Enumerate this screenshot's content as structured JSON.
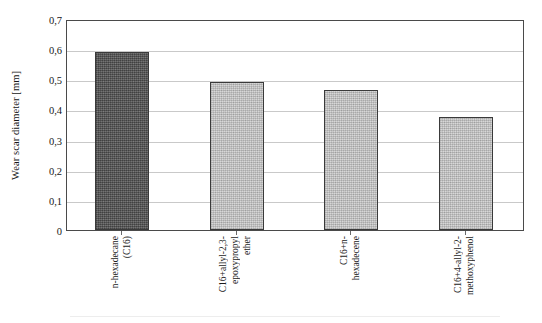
{
  "chart_data": {
    "type": "bar",
    "title": "",
    "xlabel": "",
    "ylabel": "Wear scar diameter [mm]",
    "ylim": [
      0,
      0.7
    ],
    "grid": true,
    "legend": "none",
    "decimal_separator": ",",
    "ytick_labels": [
      "0",
      "0,1",
      "0,2",
      "0,3",
      "0,4",
      "0,5",
      "0,6",
      "0,7"
    ],
    "ytick_values": [
      0,
      0.1,
      0.2,
      0.3,
      0.4,
      0.5,
      0.6,
      0.7
    ],
    "categories": [
      "n-hexadecane (C16)",
      "C16+allyl-2,3-epoxypropyl ether",
      "C16+n-hexadecene",
      "C16+4-allyl-2-methoxyphenol"
    ],
    "category_lines": [
      [
        "n-hexadecane",
        "(C16)"
      ],
      [
        "C16+allyl-2,3-",
        "epoxypropyl",
        "ether"
      ],
      [
        "C16+n-",
        "hexadecene"
      ],
      [
        "C16+4-allyl-2-",
        "methoxyphenol"
      ]
    ],
    "values": [
      0.59,
      0.49,
      0.465,
      0.375
    ],
    "bar_colors": [
      "#585858",
      "#cfcfcf",
      "#cfcfcf",
      "#cfcfcf"
    ],
    "bar_border_color": "#3a3a3a",
    "gridline_color": "#c9c9c9",
    "frame_color": "#4a4a4a",
    "background": "#ffffff"
  }
}
